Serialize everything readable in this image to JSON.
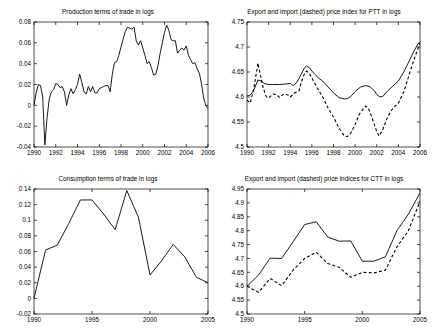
{
  "figure": {
    "background_color": "#ffffff",
    "line_color": "#000000",
    "panel_count": 4,
    "width": 432,
    "height": 334
  },
  "chart_data": [
    {
      "id": "production-terms-of-trade",
      "type": "line",
      "title": "Production terms of trade in logs",
      "xlabel": "",
      "ylabel": "",
      "xlim": [
        1990,
        2006
      ],
      "ylim": [
        -0.04,
        0.08
      ],
      "grid": false,
      "legend": "none",
      "xticks": [
        1990,
        1992,
        1994,
        1996,
        1998,
        2000,
        2002,
        2004,
        2006
      ],
      "xticklabels": [
        "1990",
        "1992",
        "1994",
        "1996",
        "1998",
        "2000",
        "2002",
        "2004",
        "2006"
      ],
      "yticks": [
        -0.04,
        -0.02,
        0,
        0.02,
        0.04,
        0.06,
        0.08
      ],
      "yticklabels": [
        "-0.04",
        "-0.02",
        "0",
        "0.02",
        "0.04",
        "0.06",
        "0.08"
      ],
      "series": [
        {
          "name": "Production terms of trade",
          "style": "solid",
          "x": [
            1990.0,
            1990.2,
            1990.4,
            1990.6,
            1990.8,
            1991.0,
            1991.2,
            1991.4,
            1991.6,
            1991.8,
            1992.0,
            1992.2,
            1992.4,
            1992.6,
            1992.8,
            1993.0,
            1993.2,
            1993.4,
            1993.6,
            1993.8,
            1994.0,
            1994.2,
            1994.4,
            1994.6,
            1994.8,
            1995.0,
            1995.2,
            1995.4,
            1995.6,
            1995.8,
            1996.0,
            1996.2,
            1996.4,
            1996.6,
            1996.8,
            1997.0,
            1997.2,
            1997.4,
            1997.6,
            1997.8,
            1998.0,
            1998.2,
            1998.4,
            1998.6,
            1998.8,
            1999.0,
            1999.2,
            1999.4,
            1999.6,
            1999.8,
            2000.0,
            2000.2,
            2000.4,
            2000.6,
            2000.8,
            2001.0,
            2001.2,
            2001.4,
            2001.6,
            2001.8,
            2002.0,
            2002.2,
            2002.4,
            2002.6,
            2002.8,
            2003.0,
            2003.2,
            2003.4,
            2003.6,
            2003.8,
            2004.0,
            2004.2,
            2004.4,
            2004.6,
            2004.8,
            2005.0,
            2005.2,
            2005.4,
            2005.6,
            2005.8,
            2006.0
          ],
          "y": [
            0.0,
            0.012,
            0.02,
            0.019,
            0.008,
            -0.038,
            -0.012,
            0.006,
            0.013,
            0.015,
            0.021,
            0.02,
            0.017,
            0.018,
            0.013,
            0.0,
            0.01,
            0.016,
            0.011,
            0.015,
            0.02,
            0.03,
            0.022,
            0.013,
            0.011,
            0.018,
            0.013,
            0.018,
            0.012,
            0.012,
            0.016,
            0.017,
            0.018,
            0.019,
            0.019,
            0.013,
            0.03,
            0.041,
            0.042,
            0.048,
            0.056,
            0.064,
            0.071,
            0.075,
            0.074,
            0.073,
            0.075,
            0.062,
            0.058,
            0.062,
            0.055,
            0.048,
            0.04,
            0.042,
            0.036,
            0.029,
            0.03,
            0.038,
            0.05,
            0.06,
            0.07,
            0.077,
            0.072,
            0.063,
            0.062,
            0.062,
            0.05,
            0.053,
            0.055,
            0.053,
            0.057,
            0.048,
            0.044,
            0.04,
            0.041,
            0.035,
            0.031,
            0.021,
            0.007,
            0.0,
            -0.003
          ]
        }
      ]
    },
    {
      "id": "ptt-export-import-price-index",
      "type": "line",
      "title": "Export and import (dashed) price index for PTT in logs",
      "xlabel": "",
      "ylabel": "",
      "xlim": [
        1990,
        2006
      ],
      "ylim": [
        4.5,
        4.75
      ],
      "grid": false,
      "legend": "in-title",
      "xticks": [
        1990,
        1992,
        1994,
        1996,
        1998,
        2000,
        2002,
        2004,
        2006
      ],
      "xticklabels": [
        "1990",
        "1992",
        "1994",
        "1996",
        "1998",
        "2000",
        "2002",
        "2004",
        "2006"
      ],
      "yticks": [
        4.5,
        4.55,
        4.6,
        4.65,
        4.7,
        4.75
      ],
      "yticklabels": [
        "4.5",
        "4.55",
        "4.6",
        "4.65",
        "4.7",
        "4.75"
      ],
      "series": [
        {
          "name": "Export price index",
          "style": "solid",
          "x": [
            1990.0,
            1990.3,
            1990.6,
            1990.9,
            1991.0,
            1991.3,
            1991.6,
            1992.0,
            1992.5,
            1993.0,
            1993.5,
            1994.0,
            1994.3,
            1994.6,
            1995.0,
            1995.3,
            1995.5,
            1995.8,
            1996.0,
            1996.3,
            1996.6,
            1997.0,
            1997.5,
            1998.0,
            1998.5,
            1999.0,
            1999.3,
            1999.6,
            2000.0,
            2000.5,
            2001.0,
            2001.4,
            2001.8,
            2002.0,
            2002.3,
            2002.6,
            2003.0,
            2003.5,
            2004.0,
            2004.5,
            2005.0,
            2005.5,
            2005.8,
            2006.0
          ],
          "y": [
            4.602,
            4.604,
            4.612,
            4.628,
            4.634,
            4.632,
            4.627,
            4.625,
            4.625,
            4.625,
            4.626,
            4.627,
            4.623,
            4.629,
            4.645,
            4.658,
            4.662,
            4.658,
            4.652,
            4.645,
            4.638,
            4.632,
            4.62,
            4.608,
            4.599,
            4.596,
            4.597,
            4.601,
            4.611,
            4.62,
            4.623,
            4.62,
            4.612,
            4.605,
            4.6,
            4.602,
            4.612,
            4.622,
            4.632,
            4.65,
            4.672,
            4.694,
            4.706,
            4.711
          ]
        },
        {
          "name": "Import price index",
          "style": "dashed",
          "x": [
            1990.0,
            1990.3,
            1990.6,
            1990.9,
            1991.0,
            1991.2,
            1991.5,
            1991.8,
            1992.0,
            1992.4,
            1992.8,
            1993.0,
            1993.4,
            1993.8,
            1994.0,
            1994.4,
            1994.8,
            1995.0,
            1995.3,
            1995.5,
            1995.8,
            1996.0,
            1996.5,
            1997.0,
            1997.5,
            1998.0,
            1998.5,
            1999.0,
            1999.3,
            1999.6,
            2000.0,
            2000.4,
            2000.8,
            2001.0,
            2001.3,
            2001.6,
            2002.0,
            2002.2,
            2002.5,
            2003.0,
            2003.5,
            2004.0,
            2004.5,
            2005.0,
            2005.5,
            2006.0
          ],
          "y": [
            4.594,
            4.588,
            4.614,
            4.652,
            4.668,
            4.648,
            4.618,
            4.6,
            4.598,
            4.606,
            4.604,
            4.599,
            4.606,
            4.604,
            4.6,
            4.608,
            4.612,
            4.628,
            4.646,
            4.652,
            4.646,
            4.638,
            4.618,
            4.6,
            4.578,
            4.56,
            4.538,
            4.522,
            4.521,
            4.528,
            4.545,
            4.566,
            4.578,
            4.582,
            4.574,
            4.556,
            4.531,
            4.522,
            4.532,
            4.56,
            4.578,
            4.588,
            4.61,
            4.645,
            4.678,
            4.708
          ]
        }
      ]
    },
    {
      "id": "consumption-terms-of-trade",
      "type": "line",
      "title": "Consumption terms of trade in logs",
      "xlabel": "",
      "ylabel": "",
      "xlim": [
        1990,
        2005
      ],
      "ylim": [
        -0.02,
        0.14
      ],
      "grid": false,
      "legend": "none",
      "xticks": [
        1990,
        1995,
        2000,
        2005
      ],
      "xticklabels": [
        "1990",
        "1995",
        "2000",
        "2005"
      ],
      "yticks": [
        -0.02,
        0,
        0.02,
        0.04,
        0.06,
        0.08,
        0.1,
        0.12,
        0.14
      ],
      "yticklabels": [
        "-0.02",
        "0",
        "0.02",
        "0.04",
        "0.06",
        "0.08",
        "0.1",
        "0.12",
        "0.14"
      ],
      "series": [
        {
          "name": "Consumption terms of trade",
          "style": "solid",
          "x": [
            1990,
            1991,
            1992,
            1993,
            1994,
            1995,
            1996,
            1997,
            1998,
            1999,
            2000,
            2001,
            2002,
            2003,
            2004,
            2005
          ],
          "y": [
            0.0,
            0.062,
            0.068,
            0.096,
            0.126,
            0.126,
            0.108,
            0.088,
            0.138,
            0.104,
            0.03,
            0.048,
            0.069,
            0.053,
            0.027,
            0.02
          ]
        }
      ]
    },
    {
      "id": "ctt-export-import-price-indices",
      "type": "line",
      "title": "Export and import (dashed) price indices for CTT in logs",
      "xlabel": "",
      "ylabel": "",
      "xlim": [
        1990,
        2005
      ],
      "ylim": [
        4.5,
        4.95
      ],
      "grid": false,
      "legend": "in-title",
      "xticks": [
        1990,
        1995,
        2000,
        2005
      ],
      "xticklabels": [
        "1990",
        "1995",
        "2000",
        "2005"
      ],
      "yticks": [
        4.5,
        4.55,
        4.6,
        4.65,
        4.7,
        4.75,
        4.8,
        4.85,
        4.9,
        4.95
      ],
      "yticklabels": [
        "4.5",
        "4.55",
        "4.6",
        "4.65",
        "4.7",
        "4.75",
        "4.8",
        "4.85",
        "4.9",
        "4.95"
      ],
      "series": [
        {
          "name": "Export price index",
          "style": "solid",
          "x": [
            1990,
            1991,
            1992,
            1993,
            1994,
            1995,
            1996,
            1997,
            1998,
            1999,
            2000,
            2001,
            2002,
            2003,
            2004,
            2005
          ],
          "y": [
            4.6,
            4.64,
            4.701,
            4.7,
            4.76,
            4.822,
            4.832,
            4.777,
            4.762,
            4.763,
            4.69,
            4.69,
            4.706,
            4.8,
            4.86,
            4.936
          ]
        },
        {
          "name": "Import price index",
          "style": "dashed",
          "x": [
            1990,
            1991,
            1992,
            1993,
            1994,
            1995,
            1996,
            1997,
            1998,
            1999,
            2000,
            2001,
            2002,
            2003,
            2004,
            2005
          ],
          "y": [
            4.6,
            4.578,
            4.628,
            4.602,
            4.658,
            4.7,
            4.722,
            4.682,
            4.668,
            4.632,
            4.65,
            4.648,
            4.658,
            4.742,
            4.8,
            4.906
          ]
        }
      ]
    }
  ]
}
